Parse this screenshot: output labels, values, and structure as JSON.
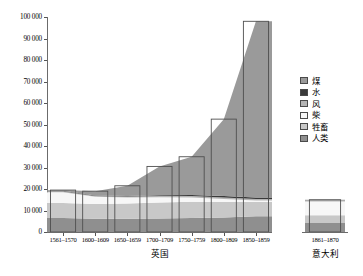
{
  "chart_data": {
    "type": "area",
    "title": "",
    "xlabel": "",
    "ylabel": "",
    "ylim": [
      0,
      100000
    ],
    "yticks": [
      "0",
      "10 000",
      "20 000",
      "30 000",
      "40 000",
      "50 000",
      "60 000",
      "70 000",
      "80 000",
      "90 000",
      "100 000"
    ],
    "grid": false,
    "legend_position": "right",
    "panels": [
      {
        "name": "britain",
        "title": "英国",
        "categories": [
          "1561–1570",
          "1600–1609",
          "1650–1659",
          "1700–1709",
          "1750–1759",
          "1800–1809",
          "1850–1859"
        ],
        "series": [
          {
            "name": "人类",
            "color": "#8f8f8f",
            "values": [
              6500,
              6200,
              6200,
              6300,
              6500,
              6800,
              7300
            ]
          },
          {
            "name": "牲畜",
            "color": "#c8c8c8",
            "values": [
              7000,
              6800,
              7000,
              7400,
              7600,
              7200,
              6700
            ]
          },
          {
            "name": "柴",
            "color": "#f7f7f7",
            "values": [
              5000,
              3400,
              2900,
              2500,
              2000,
              1400,
              600
            ]
          },
          {
            "name": "风",
            "color": "#b4b4b4",
            "values": [
              400,
              350,
              400,
              500,
              600,
              700,
              800
            ]
          },
          {
            "name": "水",
            "color": "#3a3a3a",
            "values": [
              300,
              250,
              300,
              400,
              500,
              600,
              700
            ]
          },
          {
            "name": "煤",
            "color": "#9a9a9a",
            "values": [
              300,
              2000,
              4700,
              13400,
              17800,
              35800,
              81900
            ]
          }
        ],
        "totals": [
          19500,
          19000,
          21500,
          30500,
          35000,
          52500,
          98000
        ]
      },
      {
        "name": "italy",
        "title": "意大利",
        "categories": [
          "1861–1870"
        ],
        "series": [
          {
            "name": "人类",
            "color": "#8f8f8f",
            "values": [
              4200
            ]
          },
          {
            "name": "牲畜",
            "color": "#c8c8c8",
            "values": [
              3600
            ]
          },
          {
            "name": "柴",
            "color": "#f7f7f7",
            "values": [
              6400
            ]
          },
          {
            "name": "风",
            "color": "#b4b4b4",
            "values": [
              300
            ]
          },
          {
            "name": "水",
            "color": "#3a3a3a",
            "values": [
              200
            ]
          },
          {
            "name": "煤",
            "color": "#9a9a9a",
            "values": [
              300
            ]
          }
        ],
        "totals": [
          15000
        ]
      }
    ],
    "legend": [
      {
        "label": "煤",
        "color": "#9a9a9a"
      },
      {
        "label": "水",
        "color": "#3a3a3a"
      },
      {
        "label": "风",
        "color": "#b4b4b4"
      },
      {
        "label": "柴",
        "color": "#f7f7f7"
      },
      {
        "label": "牲畜",
        "color": "#c8c8c8"
      },
      {
        "label": "人类",
        "color": "#8f8f8f"
      }
    ]
  }
}
